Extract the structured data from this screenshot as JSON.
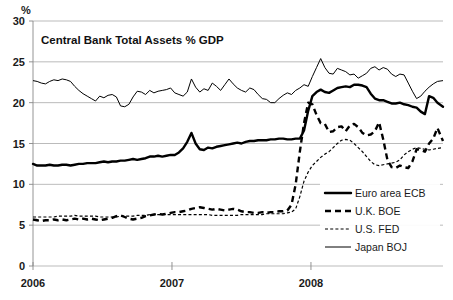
{
  "chart_data": {
    "type": "line",
    "title": "Central Bank Total Assets % GDP",
    "xlabel": "",
    "ylabel": "%",
    "ylim": [
      0,
      30
    ],
    "xlim": [
      2006.0,
      2008.95
    ],
    "yticks": [
      0,
      5,
      10,
      15,
      20,
      25,
      30
    ],
    "ytick_labels": [
      "0",
      "5",
      "10",
      "15",
      "20",
      "25",
      "30"
    ],
    "xticks": [
      2006,
      2007,
      2008
    ],
    "xtick_labels": [
      "2006",
      "2007",
      "2008"
    ],
    "grid": true,
    "legend_position": "lower-right",
    "series": [
      {
        "name": "Euro area ECB",
        "style": "thick-solid",
        "color": "#000000",
        "x": [
          2006.0,
          2006.03,
          2006.06,
          2006.09,
          2006.12,
          2006.15,
          2006.18,
          2006.21,
          2006.24,
          2006.27,
          2006.3,
          2006.33,
          2006.36,
          2006.39,
          2006.42,
          2006.45,
          2006.48,
          2006.51,
          2006.54,
          2006.57,
          2006.6,
          2006.63,
          2006.66,
          2006.69,
          2006.72,
          2006.75,
          2006.78,
          2006.81,
          2006.84,
          2006.87,
          2006.9,
          2006.93,
          2006.96,
          2006.99,
          2007.02,
          2007.05,
          2007.08,
          2007.11,
          2007.14,
          2007.17,
          2007.2,
          2007.23,
          2007.26,
          2007.29,
          2007.32,
          2007.35,
          2007.38,
          2007.41,
          2007.44,
          2007.47,
          2007.5,
          2007.53,
          2007.56,
          2007.59,
          2007.62,
          2007.65,
          2007.68,
          2007.71,
          2007.74,
          2007.77,
          2007.8,
          2007.83,
          2007.86,
          2007.89,
          2007.92,
          2007.95,
          2007.98,
          2008.01,
          2008.04,
          2008.07,
          2008.1,
          2008.13,
          2008.16,
          2008.19,
          2008.22,
          2008.25,
          2008.28,
          2008.31,
          2008.34,
          2008.37,
          2008.4,
          2008.43,
          2008.46,
          2008.49,
          2008.52,
          2008.55,
          2008.58,
          2008.61,
          2008.64,
          2008.67,
          2008.7,
          2008.73,
          2008.76,
          2008.79,
          2008.82,
          2008.85,
          2008.88,
          2008.91,
          2008.95
        ],
        "values": [
          12.5,
          12.3,
          12.3,
          12.3,
          12.4,
          12.3,
          12.3,
          12.4,
          12.4,
          12.3,
          12.4,
          12.5,
          12.5,
          12.6,
          12.6,
          12.6,
          12.7,
          12.8,
          12.7,
          12.8,
          12.8,
          12.9,
          12.9,
          13.0,
          13.1,
          13.0,
          13.1,
          13.2,
          13.4,
          13.4,
          13.5,
          13.4,
          13.5,
          13.6,
          13.6,
          13.9,
          14.4,
          15.2,
          16.3,
          15.0,
          14.3,
          14.2,
          14.5,
          14.4,
          14.6,
          14.7,
          14.8,
          14.9,
          15.0,
          15.1,
          15.0,
          15.2,
          15.3,
          15.3,
          15.4,
          15.4,
          15.4,
          15.5,
          15.5,
          15.6,
          15.6,
          15.5,
          15.5,
          15.6,
          15.6,
          16.6,
          19.0,
          20.8,
          21.3,
          21.6,
          21.3,
          21.2,
          21.5,
          21.8,
          21.9,
          22.0,
          21.9,
          22.2,
          22.2,
          22.1,
          21.9,
          21.1,
          20.5,
          20.3,
          20.3,
          20.1,
          19.9,
          19.9,
          20.0,
          19.8,
          19.7,
          19.5,
          19.4,
          18.9,
          18.6,
          20.8,
          20.6,
          20.0,
          19.5
        ]
      },
      {
        "name": "U.K. BOE",
        "style": "thick-dashed",
        "color": "#000000",
        "x": [
          2006.0,
          2006.03,
          2006.06,
          2006.09,
          2006.12,
          2006.15,
          2006.18,
          2006.21,
          2006.24,
          2006.27,
          2006.3,
          2006.33,
          2006.36,
          2006.39,
          2006.42,
          2006.45,
          2006.48,
          2006.51,
          2006.54,
          2006.57,
          2006.6,
          2006.63,
          2006.66,
          2006.69,
          2006.72,
          2006.75,
          2006.78,
          2006.81,
          2006.84,
          2006.87,
          2006.9,
          2006.93,
          2006.96,
          2006.99,
          2007.02,
          2007.05,
          2007.08,
          2007.11,
          2007.14,
          2007.17,
          2007.2,
          2007.23,
          2007.26,
          2007.29,
          2007.32,
          2007.35,
          2007.38,
          2007.41,
          2007.44,
          2007.47,
          2007.5,
          2007.53,
          2007.56,
          2007.59,
          2007.62,
          2007.65,
          2007.68,
          2007.71,
          2007.74,
          2007.77,
          2007.8,
          2007.83,
          2007.86,
          2007.89,
          2007.92,
          2007.95,
          2007.98,
          2008.01,
          2008.04,
          2008.07,
          2008.1,
          2008.13,
          2008.16,
          2008.19,
          2008.22,
          2008.25,
          2008.28,
          2008.31,
          2008.34,
          2008.37,
          2008.4,
          2008.43,
          2008.46,
          2008.49,
          2008.52,
          2008.55,
          2008.58,
          2008.61,
          2008.64,
          2008.67,
          2008.7,
          2008.73,
          2008.76,
          2008.79,
          2008.82,
          2008.85,
          2008.88,
          2008.91,
          2008.95
        ],
        "values": [
          5.7,
          5.6,
          5.5,
          5.6,
          5.6,
          5.7,
          5.6,
          5.7,
          5.6,
          5.7,
          5.8,
          5.7,
          5.8,
          5.7,
          5.8,
          5.7,
          5.6,
          5.7,
          5.8,
          5.9,
          6.1,
          6.2,
          6.0,
          5.8,
          5.7,
          5.8,
          5.9,
          6.1,
          6.2,
          6.3,
          6.4,
          6.3,
          6.4,
          6.5,
          6.6,
          6.6,
          6.7,
          6.8,
          7.0,
          7.1,
          7.2,
          7.1,
          7.0,
          6.9,
          7.0,
          6.9,
          6.8,
          6.9,
          7.0,
          6.9,
          6.7,
          6.6,
          6.6,
          6.5,
          6.5,
          6.6,
          6.5,
          6.6,
          6.6,
          6.7,
          6.7,
          6.8,
          7.5,
          10.0,
          14.0,
          17.5,
          20.0,
          19.8,
          18.5,
          17.5,
          17.4,
          16.4,
          16.5,
          17.0,
          17.1,
          16.5,
          17.2,
          17.4,
          17.0,
          16.3,
          16.0,
          16.1,
          16.5,
          17.6,
          15.5,
          13.0,
          12.1,
          12.0,
          12.3,
          12.1,
          12.0,
          12.8,
          14.3,
          14.2,
          14.0,
          15.0,
          15.6,
          16.9,
          15.3
        ]
      },
      {
        "name": "U.S. FED",
        "style": "thin-dotted",
        "color": "#000000",
        "x": [
          2006.0,
          2006.03,
          2006.06,
          2006.09,
          2006.12,
          2006.15,
          2006.18,
          2006.21,
          2006.24,
          2006.27,
          2006.3,
          2006.33,
          2006.36,
          2006.39,
          2006.42,
          2006.45,
          2006.48,
          2006.51,
          2006.54,
          2006.57,
          2006.6,
          2006.63,
          2006.66,
          2006.69,
          2006.72,
          2006.75,
          2006.78,
          2006.81,
          2006.84,
          2006.87,
          2006.9,
          2006.93,
          2006.96,
          2006.99,
          2007.02,
          2007.05,
          2007.08,
          2007.11,
          2007.14,
          2007.17,
          2007.2,
          2007.23,
          2007.26,
          2007.29,
          2007.32,
          2007.35,
          2007.38,
          2007.41,
          2007.44,
          2007.47,
          2007.5,
          2007.53,
          2007.56,
          2007.59,
          2007.62,
          2007.65,
          2007.68,
          2007.71,
          2007.74,
          2007.77,
          2007.8,
          2007.83,
          2007.86,
          2007.89,
          2007.92,
          2007.95,
          2007.98,
          2008.01,
          2008.04,
          2008.07,
          2008.1,
          2008.13,
          2008.16,
          2008.19,
          2008.22,
          2008.25,
          2008.28,
          2008.31,
          2008.34,
          2008.37,
          2008.4,
          2008.43,
          2008.46,
          2008.49,
          2008.52,
          2008.55,
          2008.58,
          2008.61,
          2008.64,
          2008.67,
          2008.7,
          2008.73,
          2008.76,
          2008.79,
          2008.82,
          2008.85,
          2008.88,
          2008.91,
          2008.95
        ],
        "values": [
          6.0,
          6.0,
          6.0,
          6.0,
          6.0,
          6.0,
          6.1,
          6.1,
          6.1,
          6.1,
          6.2,
          6.1,
          6.1,
          6.1,
          6.1,
          6.1,
          6.0,
          6.0,
          6.0,
          6.0,
          6.0,
          6.1,
          6.1,
          6.1,
          6.1,
          6.2,
          6.2,
          6.2,
          6.3,
          6.3,
          6.3,
          6.3,
          6.3,
          6.3,
          6.3,
          6.3,
          6.3,
          6.3,
          6.3,
          6.3,
          6.3,
          6.3,
          6.3,
          6.2,
          6.2,
          6.2,
          6.2,
          6.2,
          6.2,
          6.2,
          6.3,
          6.3,
          6.3,
          6.3,
          6.3,
          6.3,
          6.4,
          6.4,
          6.4,
          6.4,
          6.4,
          6.5,
          6.6,
          7.0,
          8.5,
          10.4,
          11.5,
          12.3,
          12.8,
          13.3,
          13.7,
          14.0,
          14.5,
          15.0,
          15.4,
          15.5,
          15.4,
          15.0,
          14.5,
          14.0,
          13.4,
          12.8,
          12.4,
          12.3,
          12.4,
          12.5,
          12.6,
          12.7,
          13.0,
          13.6,
          14.0,
          14.3,
          14.5,
          14.4,
          14.3,
          14.2,
          14.3,
          14.4,
          14.5
        ]
      },
      {
        "name": "Japan BOJ",
        "style": "thin-solid",
        "color": "#000000",
        "x": [
          2006.0,
          2006.03,
          2006.06,
          2006.09,
          2006.12,
          2006.15,
          2006.18,
          2006.21,
          2006.24,
          2006.27,
          2006.3,
          2006.33,
          2006.36,
          2006.39,
          2006.42,
          2006.45,
          2006.48,
          2006.51,
          2006.54,
          2006.57,
          2006.6,
          2006.63,
          2006.66,
          2006.69,
          2006.72,
          2006.75,
          2006.78,
          2006.81,
          2006.84,
          2006.87,
          2006.9,
          2006.93,
          2006.96,
          2006.99,
          2007.02,
          2007.05,
          2007.08,
          2007.11,
          2007.14,
          2007.17,
          2007.2,
          2007.23,
          2007.26,
          2007.29,
          2007.32,
          2007.35,
          2007.38,
          2007.41,
          2007.44,
          2007.47,
          2007.5,
          2007.53,
          2007.56,
          2007.59,
          2007.62,
          2007.65,
          2007.68,
          2007.71,
          2007.74,
          2007.77,
          2007.8,
          2007.83,
          2007.86,
          2007.89,
          2007.92,
          2007.95,
          2007.98,
          2008.01,
          2008.04,
          2008.07,
          2008.1,
          2008.13,
          2008.16,
          2008.19,
          2008.22,
          2008.25,
          2008.28,
          2008.31,
          2008.34,
          2008.37,
          2008.4,
          2008.43,
          2008.46,
          2008.49,
          2008.52,
          2008.55,
          2008.58,
          2008.61,
          2008.64,
          2008.67,
          2008.7,
          2008.73,
          2008.76,
          2008.79,
          2008.82,
          2008.85,
          2008.88,
          2008.91,
          2008.95
        ],
        "values": [
          22.7,
          22.6,
          22.4,
          22.3,
          22.6,
          22.8,
          22.7,
          22.9,
          22.8,
          22.6,
          22.0,
          21.5,
          21.1,
          20.8,
          20.5,
          20.2,
          20.8,
          20.6,
          20.9,
          21.0,
          20.7,
          19.6,
          19.5,
          19.8,
          20.7,
          21.4,
          21.3,
          21.0,
          21.5,
          21.2,
          21.4,
          21.5,
          21.6,
          21.8,
          21.2,
          21.0,
          20.8,
          21.3,
          22.9,
          21.9,
          21.3,
          21.7,
          21.5,
          22.4,
          22.0,
          21.5,
          22.2,
          22.9,
          22.3,
          21.8,
          21.5,
          21.3,
          21.8,
          21.6,
          21.0,
          20.5,
          20.4,
          20.0,
          20.0,
          20.5,
          20.9,
          21.2,
          21.0,
          21.5,
          21.8,
          22.2,
          22.0,
          23.2,
          24.3,
          25.4,
          24.3,
          23.6,
          23.5,
          24.2,
          24.0,
          23.8,
          23.4,
          23.5,
          23.0,
          23.3,
          23.6,
          24.2,
          24.4,
          24.0,
          24.3,
          24.1,
          23.5,
          23.2,
          23.5,
          23.4,
          22.4,
          21.4,
          20.5,
          20.8,
          21.4,
          21.9,
          22.3,
          22.6,
          22.7
        ]
      }
    ]
  },
  "legend": {
    "items": [
      {
        "label": "Euro area ECB",
        "style": "thick-solid"
      },
      {
        "label": "U.K. BOE",
        "style": "thick-dashed"
      },
      {
        "label": "U.S. FED",
        "style": "thin-dotted"
      },
      {
        "label": "Japan BOJ",
        "style": "thin-solid"
      }
    ]
  }
}
